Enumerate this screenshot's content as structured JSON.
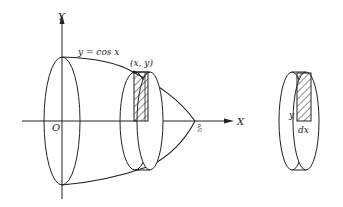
{
  "diagram": {
    "type": "solid-of-revolution",
    "axes": {
      "y_label": "Y",
      "x_label": "X",
      "origin_label": "O"
    },
    "curve_label": "y = cos x",
    "point_label": "(x, y)",
    "x_end_label": "π/2",
    "slice_detail": {
      "height_label": "y",
      "thickness_label": "dx"
    },
    "colors": {
      "stroke": "#222222",
      "background": "#ffffff"
    }
  }
}
